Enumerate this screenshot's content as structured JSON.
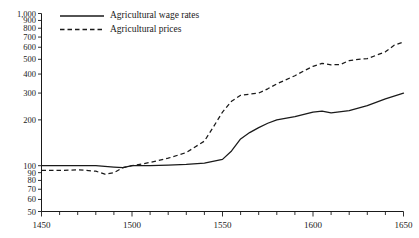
{
  "chart_data": {
    "type": "line",
    "title": "",
    "subtitle": "",
    "xlabel": "",
    "ylabel": "",
    "xlim": [
      1450,
      1650
    ],
    "ylim": [
      50,
      1000
    ],
    "yscale": "log",
    "xscale": "linear",
    "grid": false,
    "legend_position": "top-left",
    "x_major_ticks": [
      1450,
      1500,
      1550,
      1600,
      1650
    ],
    "x_major_tick_labels": [
      "1450",
      "1500",
      "1550",
      "1600",
      "1650"
    ],
    "x_minor_tick_step": 10,
    "y_ticks": [
      50,
      60,
      70,
      80,
      90,
      100,
      200,
      300,
      400,
      500,
      600,
      700,
      800,
      900,
      1000
    ],
    "y_tick_labels": [
      "50",
      "60",
      "70",
      "80",
      "90",
      "100",
      "200",
      "300",
      "400",
      "500",
      "600",
      "700",
      "800",
      "900",
      "1,000"
    ],
    "series": [
      {
        "name": "Agricultural wage rates",
        "style": "solid",
        "color": "#1a1a1a",
        "x": [
          1450,
          1460,
          1470,
          1480,
          1490,
          1495,
          1500,
          1510,
          1520,
          1530,
          1540,
          1550,
          1555,
          1560,
          1565,
          1570,
          1575,
          1580,
          1590,
          1600,
          1605,
          1610,
          1620,
          1630,
          1640,
          1650
        ],
        "values": [
          100,
          100,
          100,
          100,
          98,
          97,
          100,
          100,
          101,
          102,
          104,
          110,
          125,
          150,
          165,
          178,
          190,
          200,
          210,
          225,
          228,
          222,
          230,
          248,
          275,
          300
        ]
      },
      {
        "name": "Agricultural prices",
        "style": "dashed",
        "color": "#1a1a1a",
        "x": [
          1450,
          1460,
          1470,
          1480,
          1485,
          1490,
          1495,
          1500,
          1510,
          1520,
          1530,
          1540,
          1545,
          1550,
          1555,
          1560,
          1565,
          1570,
          1575,
          1580,
          1590,
          1595,
          1600,
          1605,
          1610,
          1615,
          1620,
          1625,
          1630,
          1640,
          1645,
          1650
        ],
        "values": [
          93,
          93,
          94,
          92,
          88,
          90,
          97,
          100,
          105,
          112,
          122,
          145,
          180,
          225,
          265,
          290,
          295,
          300,
          320,
          345,
          390,
          420,
          450,
          470,
          460,
          462,
          490,
          500,
          505,
          560,
          620,
          650
        ]
      }
    ],
    "annotations": []
  },
  "legend": {
    "items": [
      {
        "label": "Agricultural wage rates",
        "style": "solid"
      },
      {
        "label": "Agricultural prices",
        "style": "dashed"
      }
    ]
  }
}
